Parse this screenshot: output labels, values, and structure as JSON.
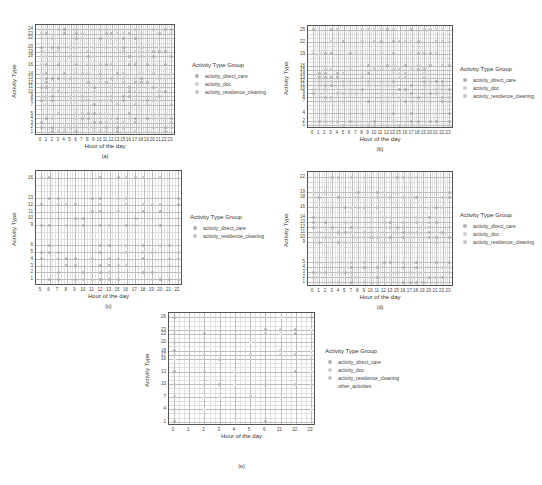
{
  "colors": {
    "activity_direct_care": "#b0b0b0",
    "activity_doc": "#cfcfcf",
    "activity_residence_cleaning": "#c4c4c4",
    "other_activities": "#e6e6e6",
    "grid_major": "#bdbdbd",
    "grid_minor": "#e0e0e0"
  },
  "chart_data": [
    {
      "id": "a",
      "type": "scatter",
      "caption": "(a)",
      "xlabel": "Hour of the day",
      "ylabel": "Activity Type",
      "x_ticks": [
        0,
        1,
        2,
        3,
        4,
        5,
        6,
        7,
        8,
        9,
        10,
        11,
        12,
        13,
        15,
        16,
        17,
        18,
        19,
        20,
        21,
        22,
        23
      ],
      "y_ticks": [
        1,
        2,
        3,
        4,
        5,
        7,
        8,
        9,
        10,
        11,
        12,
        13,
        14,
        16,
        18,
        19,
        20,
        22,
        23,
        24
      ],
      "ylim": [
        0,
        25
      ],
      "legend_title": "Activity Type Group",
      "legend": [
        "activity_direct_care",
        "activity_doc",
        "activity_residence_cleaning"
      ],
      "bbox": {
        "x": 35,
        "y": 24,
        "w": 140,
        "h": 111
      },
      "legend_pos": {
        "x": 192,
        "y": 62
      }
    },
    {
      "id": "b",
      "type": "scatter",
      "caption": "(b)",
      "xlabel": "Hour of the day",
      "ylabel": "Activity Type",
      "x_ticks": [
        0,
        1,
        2,
        3,
        4,
        5,
        6,
        7,
        8,
        9,
        10,
        11,
        12,
        13,
        15,
        16,
        17,
        18,
        19,
        20,
        21,
        22,
        23
      ],
      "y_ticks": [
        1,
        2,
        4,
        7,
        8,
        9,
        10,
        11,
        12,
        13,
        14,
        15,
        16,
        19,
        22,
        25
      ],
      "ylim": [
        0,
        26
      ],
      "legend_title": "Activity Type Group",
      "legend": [
        "activity_direct_care",
        "activity_doc",
        "activity_residence_cleaning"
      ],
      "bbox": {
        "x": 307,
        "y": 25,
        "w": 146,
        "h": 103
      },
      "legend_pos": {
        "x": 460,
        "y": 66
      }
    },
    {
      "id": "c",
      "type": "scatter",
      "caption": "(c)",
      "xlabel": "Hour of the day",
      "ylabel": "Activity Type",
      "x_ticks": [
        5,
        6,
        7,
        8,
        9,
        10,
        11,
        12,
        13,
        15,
        16,
        17,
        18,
        19,
        20,
        21,
        22
      ],
      "y_ticks": [
        1,
        2,
        3,
        4,
        5,
        6,
        9,
        10,
        11,
        12,
        13,
        16
      ],
      "ylim": [
        0,
        17
      ],
      "legend_title": "Activity Type Group",
      "legend": [
        "activity_direct_care",
        "activity_residence_cleaning"
      ],
      "bbox": {
        "x": 35,
        "y": 170,
        "w": 147,
        "h": 115
      },
      "legend_pos": {
        "x": 190,
        "y": 214
      }
    },
    {
      "id": "d",
      "type": "scatter",
      "caption": "(d)",
      "xlabel": "Hour of the day",
      "ylabel": "Activity Type",
      "x_ticks": [
        0,
        1,
        2,
        3,
        4,
        5,
        7,
        8,
        9,
        10,
        11,
        12,
        13,
        15,
        16,
        17,
        18,
        19,
        20,
        21,
        22,
        23
      ],
      "y_ticks": [
        1,
        2,
        3,
        4,
        5,
        9,
        10,
        11,
        12,
        13,
        14,
        16,
        18,
        19,
        22
      ],
      "ylim": [
        0,
        23
      ],
      "legend_title": "Activity Type Group",
      "legend": [
        "activity_direct_care",
        "activity_doc",
        "activity_residence_cleaning"
      ],
      "bbox": {
        "x": 307,
        "y": 171,
        "w": 146,
        "h": 115
      },
      "legend_pos": {
        "x": 460,
        "y": 212
      }
    },
    {
      "id": "e",
      "type": "scatter",
      "caption": "(e)",
      "xlabel": "Hour of the day",
      "ylabel": "Activity Type",
      "x_ticks": [
        0,
        1,
        2,
        3,
        4,
        5,
        6,
        21,
        22,
        23
      ],
      "y_ticks": [
        1,
        4,
        7,
        10,
        13,
        16,
        17,
        18,
        20,
        22,
        23,
        26
      ],
      "ylim": [
        0,
        27
      ],
      "legend_title": "Activity Type Group",
      "legend": [
        "activity_direct_care",
        "activity_doc",
        "activity_residence_cleaning",
        "other_activities"
      ],
      "bbox": {
        "x": 168,
        "y": 312,
        "w": 147,
        "h": 113
      },
      "legend_pos": {
        "x": 325,
        "y": 348
      }
    }
  ]
}
